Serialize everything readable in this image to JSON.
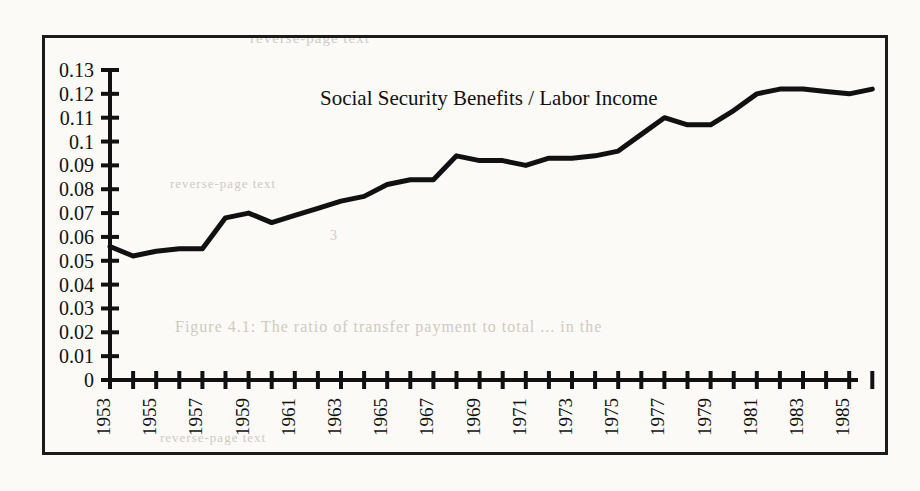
{
  "figure": {
    "title": "Social Security Benefits / Labor Income",
    "frame_color": "#1b1b1b",
    "line_color": "#111111",
    "background_color": "#fbfaf7"
  },
  "bleed_through": {
    "line1": "reverse-page text",
    "line2": "reverse-page text",
    "line3": "3",
    "line4": "Figure 4.1:  The ratio of transfer payment to total ... in the",
    "line5": "reverse-page text"
  },
  "axes": {
    "y_ticks": [
      "0.13",
      "0.12",
      "0.11",
      "0.1",
      "0.09",
      "0.08",
      "0.07",
      "0.06",
      "0.05",
      "0.04",
      "0.03",
      "0.02",
      "0.01",
      "0"
    ],
    "x_ticks": [
      "1953",
      "1955",
      "1957",
      "1959",
      "1961",
      "1963",
      "1965",
      "1967",
      "1969",
      "1971",
      "1973",
      "1975",
      "1977",
      "1979",
      "1981",
      "1983",
      "1985"
    ]
  },
  "chart_data": {
    "type": "line",
    "title": "Social Security Benefits / Labor Income",
    "xlabel": "",
    "ylabel": "",
    "ylim": [
      0,
      0.13
    ],
    "xlim": [
      1953,
      1986
    ],
    "grid": false,
    "legend": false,
    "y_tick_values": [
      0,
      0.01,
      0.02,
      0.03,
      0.04,
      0.05,
      0.06,
      0.07,
      0.08,
      0.09,
      0.1,
      0.11,
      0.12,
      0.13
    ],
    "x_tick_values": [
      1953,
      1954,
      1955,
      1956,
      1957,
      1958,
      1959,
      1960,
      1961,
      1962,
      1963,
      1964,
      1965,
      1966,
      1967,
      1968,
      1969,
      1970,
      1971,
      1972,
      1973,
      1974,
      1975,
      1976,
      1977,
      1978,
      1979,
      1980,
      1981,
      1982,
      1983,
      1984,
      1985,
      1986
    ],
    "x_labeled_ticks": [
      1953,
      1955,
      1957,
      1959,
      1961,
      1963,
      1965,
      1967,
      1969,
      1971,
      1973,
      1975,
      1977,
      1979,
      1981,
      1983,
      1985
    ],
    "series": [
      {
        "name": "Social Security Benefits / Labor Income",
        "x": [
          1953,
          1954,
          1955,
          1956,
          1957,
          1958,
          1959,
          1960,
          1961,
          1962,
          1963,
          1964,
          1965,
          1966,
          1967,
          1968,
          1969,
          1970,
          1971,
          1972,
          1973,
          1974,
          1975,
          1976,
          1977,
          1978,
          1979,
          1980,
          1981,
          1982,
          1983,
          1984,
          1985,
          1986
        ],
        "values": [
          0.056,
          0.052,
          0.054,
          0.055,
          0.055,
          0.068,
          0.07,
          0.066,
          0.069,
          0.072,
          0.075,
          0.077,
          0.082,
          0.084,
          0.084,
          0.094,
          0.092,
          0.092,
          0.09,
          0.093,
          0.093,
          0.094,
          0.096,
          0.103,
          0.11,
          0.107,
          0.107,
          0.113,
          0.12,
          0.122,
          0.122,
          0.121,
          0.12,
          0.122
        ]
      }
    ]
  }
}
